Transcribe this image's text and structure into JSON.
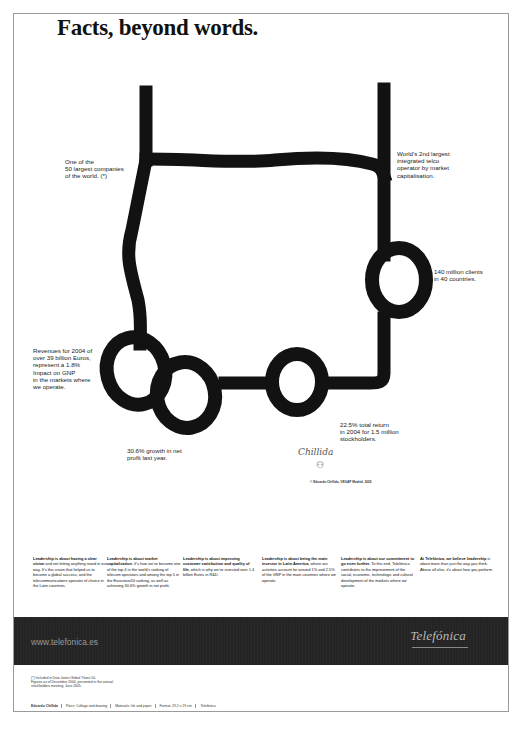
{
  "headline": "Facts, beyond words.",
  "artwork": {
    "description": "Hand-drawn thick black line sculpture outline with loops",
    "stroke_color": "#121212"
  },
  "callouts": [
    {
      "id": "companies",
      "text": "One of the\n50 largest companies\nof the world. (*)"
    },
    {
      "id": "telco",
      "text": "World's 2nd largest\nintegrated telco\noperator by market\ncapitalisation."
    },
    {
      "id": "clients",
      "text": "140 million clients\nin 40 countries."
    },
    {
      "id": "revenues",
      "text": "Revenues for 2004 of\nover 39 billion Euros,\nrepresent a 1.8%\nImpact on GNP\nin the markets where\nwe operate."
    },
    {
      "id": "growth",
      "text": "30.6% growth in net\nprofit last year."
    },
    {
      "id": "return",
      "text": "22.5% total return\nin 2004 for 1.5 million\nstockholders."
    }
  ],
  "signature": "Chillida",
  "copyright": "© Eduardo Chillida, VEGAP Madrid, 2005",
  "columns": [
    {
      "lead": "Leadership is about having a clear vision",
      "body": " and not letting anything stand in our way. It's this vision that helped us to become a global success, and the telecommunications operator of choice in the Latin countries."
    },
    {
      "lead": "Leadership is about market capitalisation.",
      "body": " It's how we've become one of the top 4 in the world's ranking of telecom operators and among the top 5 in the Eurostoxx50 ranking, as well as achieving 30.6% growth in net profit."
    },
    {
      "lead": "Leadership is about improving customer satisfaction and quality of life,",
      "body": " which is why we've invested over 1.4 billion Euros in R&D."
    },
    {
      "lead": "Leadership is about being the main investor in Latin America,",
      "body": " where our activities account for around 1% and 2.5% of the GNP in the main countries where we operate."
    },
    {
      "lead": "Leadership is about our commitment to go even further.",
      "body": " To this end, Telefónica contributes to the improvement of the social, economic, technologic and cultural development of the markets where we operate."
    },
    {
      "lead": "At Telefónica, we believe leadership",
      "body": " is about more than just the way you think. Above all else, it's about how you perform."
    }
  ],
  "band": {
    "url": "www.telefonica.es",
    "logo": "Telefónica",
    "background": "#262626"
  },
  "footnote": "(*) Included in Dow Jones Global Titans 50.\nFigures as of December 2004, presented in the annual stockholders meeting, June 2005.",
  "credits": [
    "Eduardo Chillida",
    "Piece: Collage and drawing",
    "Materials: Ink and paper",
    "Format: 29.2 x 19 cm.",
    "Telefónica"
  ]
}
